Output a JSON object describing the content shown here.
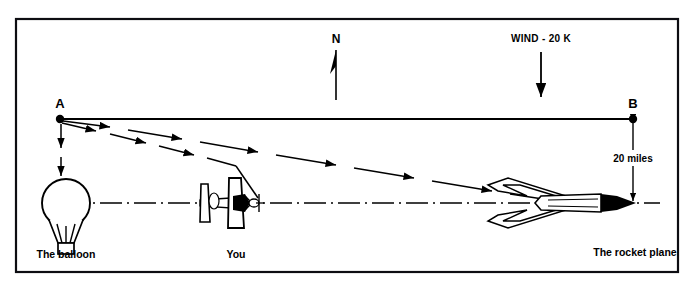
{
  "figure": {
    "type": "navigation-diagram",
    "background_color": "#ffffff",
    "ink_color": "#000000",
    "frame": {
      "x": 16,
      "y": 19,
      "width": 662,
      "height": 253
    }
  },
  "compass": {
    "label": "N",
    "direction": "up",
    "x": 336,
    "y": 36
  },
  "wind": {
    "label": "WIND - 20 K",
    "speed_knots": 20,
    "direction": "down",
    "arrow_x": 541,
    "arrow_y_top": 50,
    "arrow_y_bottom": 98
  },
  "points": [
    {
      "id": "A",
      "label": "A",
      "x": 60,
      "y": 119
    },
    {
      "id": "B",
      "label": "B",
      "x": 633,
      "y": 119
    }
  ],
  "dimension": {
    "label": "20 miles",
    "value": 20,
    "unit": "miles",
    "x": 633,
    "y_top": 119,
    "y_bottom": 203
  },
  "objects": [
    {
      "id": "balloon",
      "label": "The balloon",
      "x": 66,
      "y": 203,
      "caption_x": 66,
      "caption_y": 258
    },
    {
      "id": "you",
      "label": "You",
      "x": 236,
      "y": 203,
      "caption_x": 236,
      "caption_y": 258
    },
    {
      "id": "rocket-plane",
      "label": "The rocket  plane",
      "x": 565,
      "y": 203,
      "caption_x": 635,
      "caption_y": 256
    }
  ],
  "sight_lines": [
    {
      "from": "A",
      "to": "B",
      "style": "solid",
      "note": "baseline A to B"
    },
    {
      "from": "A",
      "to": "rocket-plane",
      "style": "dashed-arrow",
      "note": "shallow line of sight"
    },
    {
      "from": "A",
      "to": "you",
      "style": "dashed-arrow",
      "note": "steep line of sight"
    },
    {
      "from": "A",
      "to": "balloon",
      "style": "dashed-arrow-vertical",
      "note": "drop to balloon"
    }
  ],
  "horizon": {
    "style": "dash-dot",
    "y": 203,
    "x_start": 66,
    "x_end": 660
  }
}
